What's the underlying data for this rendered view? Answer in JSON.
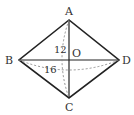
{
  "diagram": {
    "type": "rhombus-with-diagonals",
    "vertices": {
      "A": {
        "label": "A",
        "x": 69,
        "y": 20
      },
      "B": {
        "label": "B",
        "x": 19,
        "y": 60
      },
      "C": {
        "label": "C",
        "x": 69,
        "y": 98
      },
      "D": {
        "label": "D",
        "x": 119,
        "y": 60
      }
    },
    "center": {
      "label": "O"
    },
    "measurements": {
      "ac_length": "12",
      "bd_length": "16"
    },
    "colors": {
      "lines": "#222222",
      "dashed": "#888888",
      "text": "#333333"
    }
  }
}
